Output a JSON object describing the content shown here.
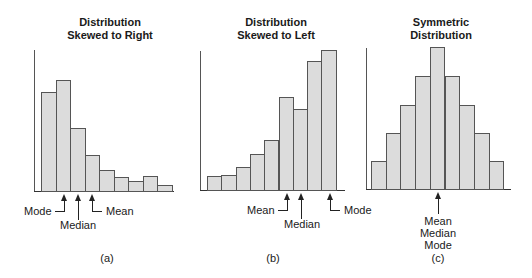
{
  "chart_data": [
    {
      "type": "bar",
      "title": "Distribution Skewed to Right",
      "caption": "(a)",
      "categories": [
        "1",
        "2",
        "3",
        "4",
        "5",
        "6",
        "7",
        "8",
        "9"
      ],
      "values": [
        99,
        111,
        63,
        36,
        21,
        14,
        10,
        15,
        6
      ],
      "xlabel": "",
      "ylabel": "",
      "annotations": [
        "Mode",
        "Median",
        "Mean"
      ]
    },
    {
      "type": "bar",
      "title": "Distribution Skewed to Left",
      "caption": "(b)",
      "categories": [
        "1",
        "2",
        "3",
        "4",
        "5",
        "6",
        "7",
        "8",
        "9"
      ],
      "values": [
        14,
        15,
        23,
        36,
        50,
        93,
        81,
        129,
        140
      ],
      "xlabel": "",
      "ylabel": "",
      "annotations": [
        "Mean",
        "Median",
        "Mode"
      ]
    },
    {
      "type": "bar",
      "title": "Symmetric Distribution",
      "caption": "(c)",
      "categories": [
        "1",
        "2",
        "3",
        "4",
        "5",
        "6",
        "7",
        "8",
        "9"
      ],
      "values": [
        28,
        56,
        84,
        113,
        142,
        113,
        84,
        56,
        28
      ],
      "xlabel": "",
      "ylabel": "",
      "annotations": [
        "Mean Median Mode"
      ]
    }
  ],
  "panels": {
    "a": {
      "title_line1": "Distribution",
      "title_line2": "Skewed to Right",
      "mode": "Mode",
      "median": "Median",
      "mean": "Mean",
      "caption": "(a)"
    },
    "b": {
      "title_line1": "Distribution",
      "title_line2": "Skewed to Left",
      "mode": "Mode",
      "median": "Median",
      "mean": "Mean",
      "caption": "(b)"
    },
    "c": {
      "title_line1": "Symmetric",
      "title_line2": "Distribution",
      "mean": "Mean",
      "median": "Median",
      "mode": "Mode",
      "caption": "(c)"
    }
  },
  "colors": {
    "bar_fill": "#dcdcdc",
    "bar_stroke": "#555555"
  }
}
